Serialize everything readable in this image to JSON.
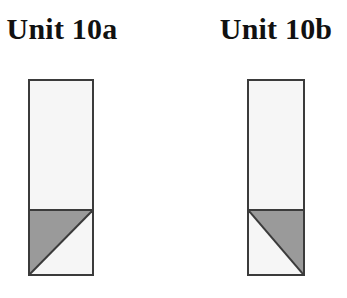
{
  "figure": {
    "background_color": "#ffffff",
    "width": 347,
    "height": 298,
    "outline_color": "#3b3b3b",
    "shaded_color": "#9a9a9a",
    "unshaded_color": "#f6f6f6"
  },
  "units": [
    {
      "label": "Unit 10a",
      "group_left": 0,
      "group_width": 124,
      "column_left": 28,
      "column_top": 79,
      "column_width": 66,
      "column_height": 197,
      "upper_height": 130,
      "lower_height": 67,
      "shaded_triangle_corner": "lower-left",
      "hypotenuse_from": "bottom-left",
      "hypotenuse_to": "top-right"
    },
    {
      "label": "Unit 10b",
      "group_left": 214,
      "group_width": 124,
      "column_left": 33,
      "column_top": 79,
      "column_width": 58,
      "column_height": 197,
      "upper_height": 130,
      "lower_height": 67,
      "shaded_triangle_corner": "upper-right",
      "hypotenuse_from": "top-left",
      "hypotenuse_to": "bottom-right"
    }
  ]
}
